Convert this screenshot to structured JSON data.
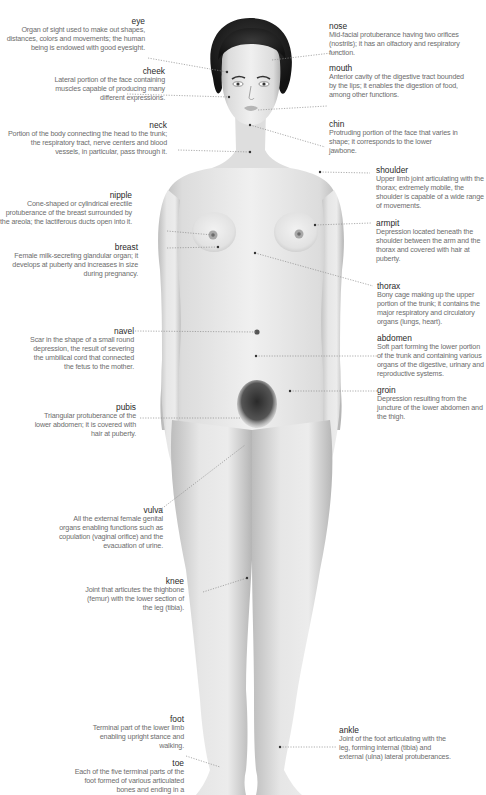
{
  "diagram": {
    "colors": {
      "skin_light": "#eeeeee",
      "skin_mid": "#d6d6d6",
      "skin_shadow": "#b9b9b9",
      "hair": "#1e1e1e",
      "leader_line": "#8a8a8a",
      "term_text": "#2a2a2a",
      "description_text": "#6d6d6d"
    },
    "labels": {
      "eye": {
        "term": "eye",
        "description": "Organ of sight used to make out shapes, distances, colors and movements; the human being is endowed with good eyesight."
      },
      "cheek": {
        "term": "cheek",
        "description": "Lateral portion of the face containing muscles capable of producing many different expressions."
      },
      "neck": {
        "term": "neck",
        "description": "Portion of the body connecting the head to the trunk; the respiratory tract, nerve centers and blood vessels, in particular, pass through it."
      },
      "nipple": {
        "term": "nipple",
        "description": "Cone-shaped or cylindrical erectile protuberance of the breast surrounded by the areola; the lactiferous ducts open into it."
      },
      "breast": {
        "term": "breast",
        "description": "Female milk-secreting glandular organ; it develops at puberty and increases in size during pregnancy."
      },
      "navel": {
        "term": "navel",
        "description": "Scar in the shape of a small round depression, the result of severing the umbilical cord that connected the fetus to the mother."
      },
      "pubis": {
        "term": "pubis",
        "description": "Triangular protuberance of the lower abdomen; it is covered with hair at puberty."
      },
      "vulva": {
        "term": "vulva",
        "description": "All the external female genital organs enabling functions such as copulation (vaginal orifice) and the evacuation of urine."
      },
      "knee": {
        "term": "knee",
        "description": "Joint that articutes the thighbone (femur) with the lower section of the leg (tibia)."
      },
      "foot": {
        "term": "foot",
        "description": "Terminal part of the lower limb enabling upright stance and walking."
      },
      "toe": {
        "term": "toe",
        "description": "Each of the five terminal parts of the foot formed of various articulated bones and ending in a"
      },
      "nose": {
        "term": "nose",
        "description": "Mid-facial protuberance having two orifices (nostrils); it has an olfactory and respiratory function."
      },
      "mouth": {
        "term": "mouth",
        "description": "Anterior cavity of the digestive tract bounded by the lips; it enables the digestion of food, among other functions."
      },
      "chin": {
        "term": "chin",
        "description": "Protruding portion of the face that varies in shape; it corresponds to the lower jawbone."
      },
      "shoulder": {
        "term": "shoulder",
        "description": "Upper limb joint articulating with the thorax; extremely mobile, the shoulder is capable of a wide range of movements."
      },
      "armpit": {
        "term": "armpit",
        "description": "Depression located beneath the shoulder between the arm and the thorax and covered with hair at puberty."
      },
      "thorax": {
        "term": "thorax",
        "description": "Bony cage making up the upper portion of the trunk; it contains the major respiratory and circulatory organs (lungs, heart)."
      },
      "abdomen": {
        "term": "abdomen",
        "description": "Soft part forming the lower portion of the trunk and containing various organs of the digestive, urinary and reproductive systems."
      },
      "groin": {
        "term": "groin",
        "description": "Depression resulting from the juncture of the lower abdomen and the thigh."
      },
      "ankle": {
        "term": "ankle",
        "description": "Joint of the foot articulating with the leg, forming internal (tibia) and external (ulna) lateral protuberances."
      }
    }
  }
}
